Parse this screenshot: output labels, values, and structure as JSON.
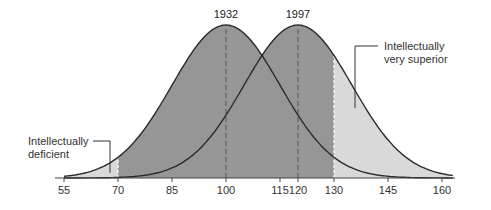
{
  "chart_data": {
    "type": "area",
    "title": "",
    "xlabel": "",
    "ylabel": "",
    "xlim": [
      55,
      162
    ],
    "x_ticks": [
      55,
      70,
      85,
      100,
      115,
      120,
      130,
      145,
      160
    ],
    "grid": false,
    "series": [
      {
        "name": "1932",
        "distribution": "normal",
        "mean": 100,
        "sd": 15
      },
      {
        "name": "1997",
        "distribution": "normal",
        "mean": 120,
        "sd": 15
      }
    ],
    "regions": [
      {
        "label": "Intellectually deficient",
        "range": [
          55,
          70
        ],
        "shade": "light"
      },
      {
        "label": "",
        "range": [
          70,
          130
        ],
        "shade": "dark"
      },
      {
        "label": "Intellectually very superior",
        "range": [
          130,
          162
        ],
        "shade": "light"
      }
    ],
    "annotations": [
      {
        "text": "1932",
        "x": 100
      },
      {
        "text": "1997",
        "x": 120
      },
      {
        "text": "Intellectually deficient",
        "x": 67
      },
      {
        "text": "Intellectually very superior",
        "x": 134
      }
    ],
    "legend": "none"
  },
  "labels": {
    "year_1932": "1932",
    "year_1997": "1997",
    "deficient_line1": "Intellectually",
    "deficient_line2": "deficient",
    "superior_line1": "Intellectually",
    "superior_line2": "very superior"
  },
  "ticks": [
    "55",
    "70",
    "85",
    "100",
    "115",
    "120",
    "130",
    "145",
    "160"
  ],
  "colors": {
    "dark_fill": "#969696",
    "light_fill": "#d9d9d9",
    "curve": "#2a2a2a"
  }
}
